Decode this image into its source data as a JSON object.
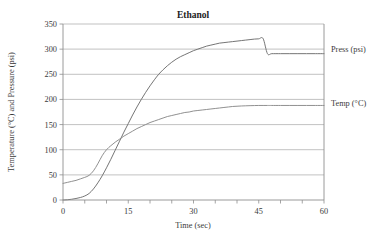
{
  "chart_data": {
    "type": "line",
    "title": "Ethanol",
    "xlabel": "Time (sec)",
    "ylabel": "Temperature (°C) and Pressure (psi)",
    "xlim": [
      0,
      60
    ],
    "ylim": [
      0,
      350
    ],
    "xticks": [
      0,
      15,
      30,
      45,
      60
    ],
    "xtick_labels": [
      "0",
      "15",
      "30",
      "45",
      "60"
    ],
    "xminor_ticks": [
      0,
      5,
      10,
      15,
      20,
      25,
      30,
      35,
      40,
      45,
      50,
      55,
      60
    ],
    "yticks": [
      0,
      50,
      100,
      150,
      200,
      250,
      300,
      350
    ],
    "ytick_labels": [
      "0",
      "50",
      "100",
      "150",
      "200",
      "250",
      "300",
      "350"
    ],
    "grid": "horizontal",
    "legend_position": "right-inline",
    "x": [
      0,
      1,
      2,
      3,
      4,
      5,
      6,
      7,
      8,
      9,
      10,
      11,
      12,
      13,
      14,
      15,
      16,
      17,
      18,
      19,
      20,
      21,
      22,
      23,
      24,
      25,
      26,
      27,
      28,
      29,
      30,
      31,
      32,
      33,
      34,
      35,
      36,
      37,
      38,
      39,
      40,
      41,
      42,
      43,
      44,
      45,
      46,
      47,
      48,
      50,
      52,
      54,
      56,
      58,
      60
    ],
    "series": [
      {
        "name": "Press (psi)",
        "label": "Press (psi)",
        "color": "#6e6e6e",
        "units": "psi",
        "start_value": 0,
        "plateau_value": 291,
        "values": [
          0,
          0.5,
          1.5,
          3,
          5,
          8,
          13,
          22,
          34,
          48,
          64,
          81,
          99,
          117,
          135,
          152,
          169,
          185,
          200,
          214,
          227,
          239,
          250,
          259,
          267,
          274,
          280,
          285,
          289,
          293,
          297,
          300,
          303,
          306,
          308,
          310,
          312,
          313,
          314,
          315,
          316,
          317,
          318,
          319,
          320,
          320.5,
          321,
          291,
          291,
          291,
          291,
          291,
          291,
          291,
          291
        ]
      },
      {
        "name": "Temp (°C)",
        "label": "Temp (°C)",
        "color": "#8a8a8a",
        "units": "°C",
        "start_value": 33,
        "plateau_value": 188,
        "values": [
          33,
          35,
          37,
          39,
          42,
          45,
          49,
          58,
          72,
          88,
          100,
          108,
          115,
          121,
          127,
          132,
          137,
          142,
          146,
          150,
          154,
          157,
          160,
          163,
          166,
          168,
          170,
          172,
          174,
          175,
          177,
          178,
          179,
          180,
          181,
          182,
          183,
          184,
          185,
          186,
          186.5,
          187,
          187.3,
          187.6,
          187.8,
          188,
          188,
          188,
          188,
          188,
          188,
          188,
          188,
          188,
          188
        ]
      }
    ],
    "annotations": []
  }
}
